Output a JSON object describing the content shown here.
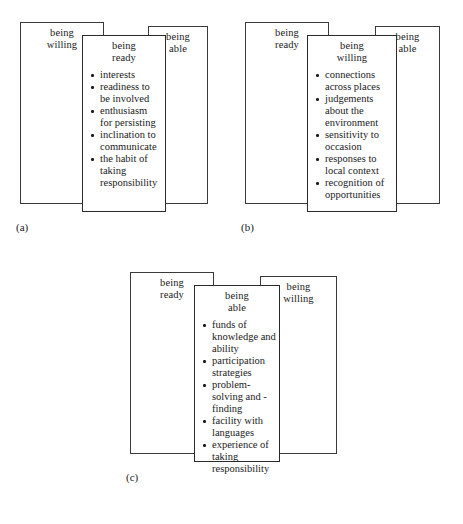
{
  "figure": {
    "background_color": "#ffffff",
    "line_color": "#3a3a3a",
    "text_color": "#1a1a1a"
  },
  "panels": [
    {
      "label": "(a)",
      "left_card": {
        "title": "being\nwilling"
      },
      "right_card": {
        "title": "being\nable"
      },
      "center_card": {
        "title": "being\nready",
        "items": [
          "interests",
          "readiness to be involved",
          "enthusiasm for persisting",
          "inclination to communicate",
          "the habit of taking responsibility"
        ]
      }
    },
    {
      "label": "(b)",
      "left_card": {
        "title": "being\nready"
      },
      "right_card": {
        "title": "being\nable"
      },
      "center_card": {
        "title": "being\nwilling",
        "items": [
          "connections across places",
          "judgements about the environment",
          "sensitivity to occasion",
          "responses to local context",
          "recognition of opportunities"
        ]
      }
    },
    {
      "label": "(c)",
      "left_card": {
        "title": "being\nready"
      },
      "right_card": {
        "title": "being\nwilling"
      },
      "center_card": {
        "title": "being\nable",
        "items": [
          "funds of knowledge and ability",
          "participation strategies",
          "problem-solving and - finding",
          "facility with languages",
          "experience of taking responsibility"
        ]
      }
    }
  ]
}
